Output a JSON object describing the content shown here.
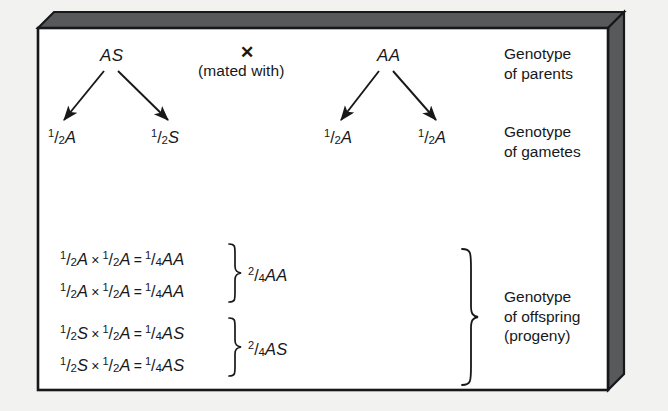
{
  "figure": {
    "type": "genetics-cross-diagram",
    "background_color": "#f2f2f0",
    "panel_color": "#ffffff",
    "box_shade_color": "#58595b",
    "ink_color": "#16181a"
  },
  "parents": {
    "left_genotype": "AS",
    "cross_symbol": "✕",
    "cross_caption": "(mated with)",
    "right_genotype": "AA"
  },
  "gametes": {
    "left": [
      {
        "num": "1",
        "den": "2",
        "allele": "A"
      },
      {
        "num": "1",
        "den": "2",
        "allele": "S"
      }
    ],
    "right": [
      {
        "num": "1",
        "den": "2",
        "allele": "A"
      },
      {
        "num": "1",
        "den": "2",
        "allele": "A"
      }
    ]
  },
  "offspring": {
    "groups": [
      {
        "rows": [
          {
            "a": {
              "num": "1",
              "den": "2",
              "allele": "A"
            },
            "op1": "×",
            "b": {
              "num": "1",
              "den": "2",
              "allele": "A"
            },
            "op2": "=",
            "result": {
              "num": "1",
              "den": "4",
              "allele": "AA"
            }
          },
          {
            "a": {
              "num": "1",
              "den": "2",
              "allele": "A"
            },
            "op1": "×",
            "b": {
              "num": "1",
              "den": "2",
              "allele": "A"
            },
            "op2": "=",
            "result": {
              "num": "1",
              "den": "4",
              "allele": "AA"
            }
          }
        ],
        "total": {
          "num": "2",
          "den": "4",
          "allele": "AA"
        }
      },
      {
        "rows": [
          {
            "a": {
              "num": "1",
              "den": "2",
              "allele": "S"
            },
            "op1": "×",
            "b": {
              "num": "1",
              "den": "2",
              "allele": "A"
            },
            "op2": "=",
            "result": {
              "num": "1",
              "den": "4",
              "allele": "AS"
            }
          },
          {
            "a": {
              "num": "1",
              "den": "2",
              "allele": "S"
            },
            "op1": "×",
            "b": {
              "num": "1",
              "den": "2",
              "allele": "A"
            },
            "op2": "=",
            "result": {
              "num": "1",
              "den": "4",
              "allele": "AS"
            }
          }
        ],
        "total": {
          "num": "2",
          "den": "4",
          "allele": "AS"
        }
      }
    ]
  },
  "row_labels": {
    "parents": "Genotype\nof parents",
    "gametes": "Genotype\nof gametes",
    "offspring": "Genotype\nof offspring\n(progeny)"
  }
}
